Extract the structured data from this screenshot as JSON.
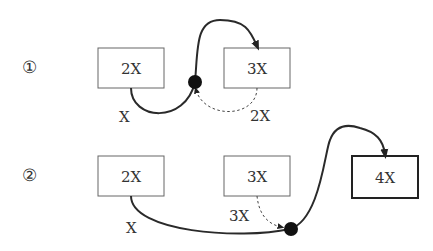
{
  "diagram": {
    "rows": [
      {
        "marker": "①",
        "boxes": [
          {
            "id": "r1-box1",
            "label": "2X"
          },
          {
            "id": "r1-box2",
            "label": "3X"
          }
        ],
        "edge_labels": {
          "solid_in": "X",
          "dashed": "2X"
        }
      },
      {
        "marker": "②",
        "boxes": [
          {
            "id": "r2-box1",
            "label": "2X"
          },
          {
            "id": "r2-box2",
            "label": "3X"
          },
          {
            "id": "r2-box3",
            "label": "4X"
          }
        ],
        "edge_labels": {
          "solid_in": "X",
          "dashed": "3X"
        }
      }
    ],
    "colors": {
      "line": "#2a2a2a",
      "box_border": "#555555",
      "dot": "#111111",
      "text": "#333333"
    }
  }
}
